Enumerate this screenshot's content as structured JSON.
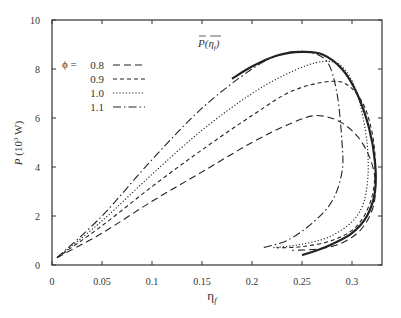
{
  "chart_data": {
    "type": "line",
    "title": "",
    "xlabel": "η_f",
    "ylabel": "P (10^3 W)",
    "xlim": [
      0,
      0.33
    ],
    "ylim": [
      0,
      10
    ],
    "grid": false,
    "legend_position": "upper-left",
    "x_ticks": [
      "0",
      "0.05",
      "0.1",
      "0.15",
      "0.2",
      "0.25",
      "0.3"
    ],
    "y_ticks": [
      "0",
      "2",
      "4",
      "6",
      "8",
      "10"
    ],
    "legend_title": "ϕ =",
    "annotation": "P̄(η̄_f)",
    "series": [
      {
        "name": "0.8",
        "style": "long-dash",
        "points": [
          [
            0.005,
            0.3
          ],
          [
            0.05,
            1.3
          ],
          [
            0.1,
            2.6
          ],
          [
            0.15,
            3.8
          ],
          [
            0.2,
            5.0
          ],
          [
            0.24,
            5.8
          ],
          [
            0.265,
            6.1
          ],
          [
            0.29,
            5.8
          ],
          [
            0.31,
            5.0
          ],
          [
            0.322,
            3.8
          ],
          [
            0.322,
            2.5
          ],
          [
            0.31,
            1.5
          ],
          [
            0.29,
            0.9
          ],
          [
            0.265,
            0.65
          ],
          [
            0.24,
            0.6
          ]
        ]
      },
      {
        "name": "0.9",
        "style": "short-dash",
        "points": [
          [
            0.005,
            0.3
          ],
          [
            0.05,
            1.6
          ],
          [
            0.1,
            3.2
          ],
          [
            0.15,
            4.7
          ],
          [
            0.2,
            6.1
          ],
          [
            0.24,
            7.1
          ],
          [
            0.28,
            7.5
          ],
          [
            0.3,
            7.2
          ],
          [
            0.315,
            6.2
          ],
          [
            0.323,
            4.5
          ],
          [
            0.32,
            2.8
          ],
          [
            0.305,
            1.6
          ],
          [
            0.28,
            1.0
          ],
          [
            0.25,
            0.75
          ],
          [
            0.225,
            0.7
          ]
        ]
      },
      {
        "name": "1.0",
        "style": "dotted",
        "points": [
          [
            0.005,
            0.3
          ],
          [
            0.05,
            1.8
          ],
          [
            0.1,
            3.7
          ],
          [
            0.15,
            5.5
          ],
          [
            0.2,
            7.0
          ],
          [
            0.24,
            7.9
          ],
          [
            0.27,
            8.3
          ],
          [
            0.29,
            8.1
          ],
          [
            0.305,
            7.0
          ],
          [
            0.315,
            5.0
          ],
          [
            0.315,
            3.2
          ],
          [
            0.305,
            2.0
          ],
          [
            0.28,
            1.2
          ],
          [
            0.25,
            0.85
          ],
          [
            0.22,
            0.7
          ]
        ]
      },
      {
        "name": "1.1",
        "style": "dash-dot",
        "points": [
          [
            0.005,
            0.3
          ],
          [
            0.05,
            2.0
          ],
          [
            0.1,
            4.3
          ],
          [
            0.15,
            6.4
          ],
          [
            0.2,
            8.0
          ],
          [
            0.23,
            8.6
          ],
          [
            0.255,
            8.7
          ],
          [
            0.275,
            8.3
          ],
          [
            0.285,
            7.0
          ],
          [
            0.29,
            5.0
          ],
          [
            0.29,
            3.8
          ],
          [
            0.28,
            2.6
          ],
          [
            0.26,
            1.7
          ],
          [
            0.235,
            1.0
          ],
          [
            0.21,
            0.7
          ]
        ]
      },
      {
        "name": "envelope",
        "style": "solid",
        "points": [
          [
            0.18,
            7.6
          ],
          [
            0.2,
            8.1
          ],
          [
            0.225,
            8.55
          ],
          [
            0.25,
            8.7
          ],
          [
            0.27,
            8.6
          ],
          [
            0.29,
            8.0
          ],
          [
            0.305,
            7.0
          ],
          [
            0.317,
            5.6
          ],
          [
            0.323,
            4.2
          ],
          [
            0.323,
            3.0
          ],
          [
            0.315,
            2.0
          ],
          [
            0.3,
            1.3
          ],
          [
            0.28,
            0.85
          ],
          [
            0.265,
            0.6
          ],
          [
            0.25,
            0.4
          ]
        ]
      }
    ]
  }
}
